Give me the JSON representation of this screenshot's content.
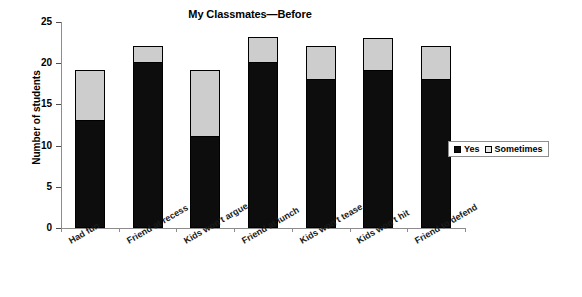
{
  "chart_data": {
    "type": "bar",
    "title": "My Classmates—Before",
    "xlabel": "",
    "ylabel": "Number of students",
    "ylim": [
      0,
      25
    ],
    "yticks": [
      0,
      5,
      10,
      15,
      20,
      25
    ],
    "grid": false,
    "stacked": true,
    "legend_position": "right-middle",
    "categories": [
      "Had fun",
      "Friend at recess",
      "Kids won't argue",
      "Friend at lunch",
      "Kids won't tease",
      "Kids won't hit",
      "Friend to defend"
    ],
    "series": [
      {
        "name": "Yes",
        "color": "#0d0d0d",
        "values": [
          13,
          20,
          11,
          20,
          18,
          19,
          18
        ]
      },
      {
        "name": "Sometimes",
        "color": "#cdcdcd",
        "values": [
          6,
          2,
          8,
          3,
          4,
          4,
          4
        ]
      }
    ],
    "totals": [
      19,
      22,
      19,
      23,
      22,
      23,
      22
    ]
  },
  "legend": {
    "items": [
      {
        "label": "Yes",
        "swatch": "black-square-icon"
      },
      {
        "label": "Sometimes",
        "swatch": "light-square-icon"
      }
    ]
  }
}
